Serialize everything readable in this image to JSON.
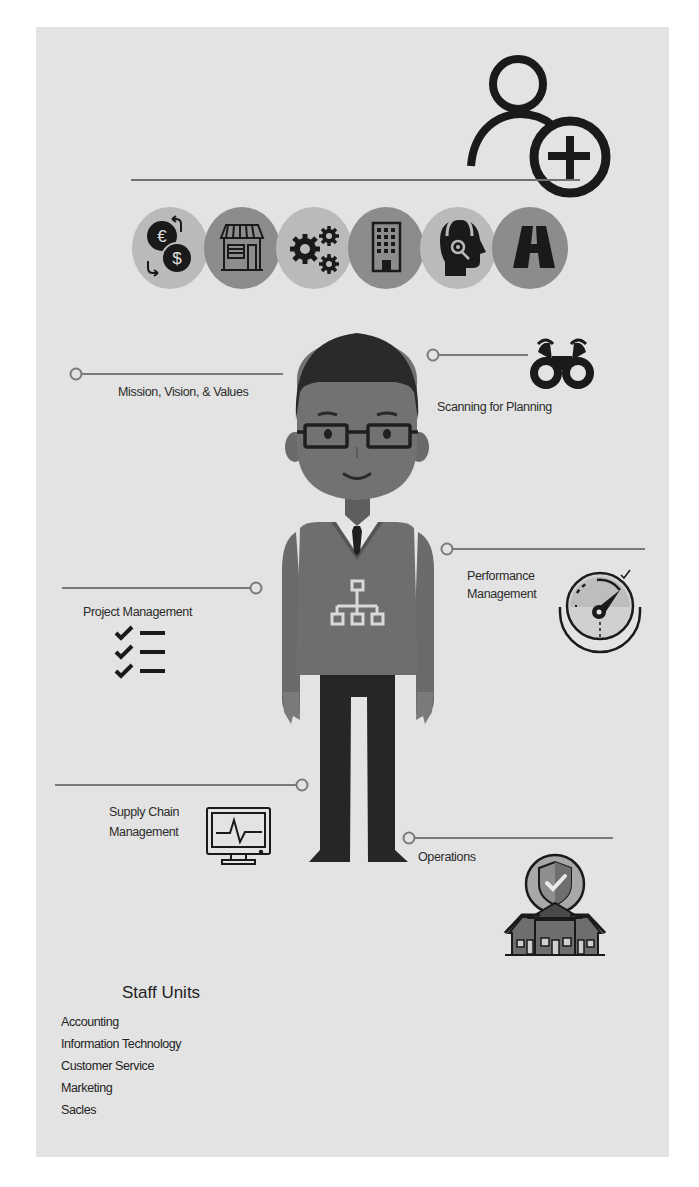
{
  "infographic": {
    "header_icon": "add-user-icon",
    "colors": {
      "background": "#e3e3e3",
      "circle_light": "#bababa",
      "circle_dark": "#8c8c8c",
      "line": "#7a7a7a",
      "icon": "#1a1a1a",
      "sweater": "#6e6e6e",
      "skin": "#727272",
      "hair": "#2a2a2a",
      "pants": "#262626"
    },
    "category_circles": [
      {
        "icon": "currency-exchange-icon",
        "shade": "light"
      },
      {
        "icon": "storefront-icon",
        "shade": "dark"
      },
      {
        "icon": "gears-icon",
        "shade": "light"
      },
      {
        "icon": "office-building-icon",
        "shade": "dark"
      },
      {
        "icon": "customer-support-headset-icon",
        "shade": "light"
      },
      {
        "icon": "road-icon",
        "shade": "dark"
      }
    ],
    "callouts": {
      "mission": {
        "label": "Mission, Vision, & Values"
      },
      "scanning": {
        "label": "Scanning for Planning",
        "icon": "binoculars-icon"
      },
      "performance": {
        "label_line1": "Performance",
        "label_line2": "Management",
        "icon": "gauge-icon"
      },
      "project": {
        "label": "Project Management",
        "icon": "checklist-icon"
      },
      "supply": {
        "label_line1": "Supply Chain",
        "label_line2": "Management",
        "icon": "monitor-pulse-icon"
      },
      "operations": {
        "label": "Operations",
        "icon": "secure-location-houses-icon"
      }
    },
    "character": {
      "shirt_icon": "org-chart-icon"
    },
    "staff_units": {
      "title": "Staff Units",
      "items": [
        "Accounting",
        "Information Technology",
        "Customer Service",
        "Marketing",
        "Sacles"
      ]
    }
  }
}
